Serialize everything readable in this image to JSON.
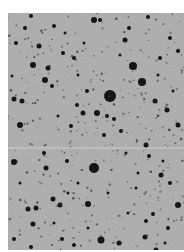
{
  "image": {
    "subject": "photographic negative star field",
    "background_color": "#b3b3b3",
    "star_color": "#141414",
    "width": 176,
    "height": 237,
    "scratch_line_y": 135,
    "stars": [
      [
        102,
        83,
        6
      ],
      [
        86,
        155,
        5
      ],
      [
        125,
        53,
        4
      ],
      [
        134,
        69,
        4
      ],
      [
        89,
        100,
        3
      ],
      [
        25,
        52,
        3
      ],
      [
        37,
        67,
        3
      ],
      [
        40,
        55,
        2.5
      ],
      [
        6,
        86,
        2.5
      ],
      [
        31,
        33,
        2.5
      ],
      [
        86,
        7,
        3
      ],
      [
        92,
        7,
        2
      ],
      [
        117,
        27,
        2.5
      ],
      [
        147,
        88,
        2.5
      ],
      [
        159,
        97,
        2.5
      ],
      [
        170,
        112,
        2.5
      ],
      [
        162,
        25,
        2
      ],
      [
        44,
        73,
        2
      ],
      [
        14,
        88,
        2.5
      ],
      [
        12,
        112,
        3
      ],
      [
        46,
        13,
        2
      ],
      [
        23,
        3,
        2
      ],
      [
        63,
        113,
        2
      ],
      [
        75,
        100,
        2.5
      ],
      [
        99,
        103,
        2
      ],
      [
        153,
        162,
        2.5
      ],
      [
        162,
        170,
        2
      ],
      [
        170,
        192,
        3
      ],
      [
        138,
        132,
        2.5
      ],
      [
        141,
        143,
        2
      ],
      [
        6,
        149,
        3
      ],
      [
        38,
        155,
        2.5
      ],
      [
        36,
        140,
        2
      ],
      [
        59,
        148,
        2
      ],
      [
        20,
        196,
        2.5
      ],
      [
        28,
        195,
        2.5
      ],
      [
        45,
        186,
        2.5
      ],
      [
        52,
        192,
        2.5
      ],
      [
        80,
        191,
        3
      ],
      [
        25,
        211,
        2.5
      ],
      [
        93,
        227,
        3.5
      ],
      [
        111,
        230,
        2.5
      ],
      [
        137,
        224,
        2.5
      ],
      [
        138,
        208,
        2
      ],
      [
        145,
        201,
        2
      ],
      [
        6,
        226,
        2
      ],
      [
        23,
        234,
        2
      ],
      [
        54,
        226,
        2
      ],
      [
        66,
        232,
        2
      ],
      [
        103,
        244,
        2
      ],
      [
        148,
        237,
        2.5
      ],
      [
        160,
        215,
        2
      ],
      [
        69,
        92,
        2
      ],
      [
        79,
        78,
        2
      ],
      [
        96,
        122,
        2
      ],
      [
        106,
        106,
        2
      ],
      [
        113,
        118,
        2
      ],
      [
        55,
        40,
        2
      ],
      [
        66,
        45,
        2
      ],
      [
        140,
        4,
        2
      ],
      [
        152,
        45,
        2
      ],
      [
        170,
        38,
        2
      ],
      [
        121,
        15,
        2
      ],
      [
        17,
        15,
        2
      ],
      [
        8,
        30,
        2
      ],
      [
        57,
        20,
        1.5
      ],
      [
        76,
        30,
        1.5
      ],
      [
        70,
        62,
        1.5
      ],
      [
        112,
        42,
        1.5
      ],
      [
        150,
        62,
        1.5
      ],
      [
        165,
        78,
        1.5
      ],
      [
        4,
        63,
        1.5
      ],
      [
        50,
        103,
        1.5
      ],
      [
        118,
        140,
        1.5
      ],
      [
        128,
        175,
        1.5
      ],
      [
        70,
        170,
        1.5
      ],
      [
        46,
        210,
        1.5
      ],
      [
        120,
        200,
        1.5
      ],
      [
        157,
        230,
        1.5
      ],
      [
        80,
        215,
        1.5
      ],
      [
        12,
        170,
        1.5
      ],
      [
        100,
        180,
        1.5
      ],
      [
        60,
        180,
        1.5
      ],
      [
        130,
        160,
        1.5
      ],
      [
        155,
        148,
        1.5
      ]
    ]
  }
}
